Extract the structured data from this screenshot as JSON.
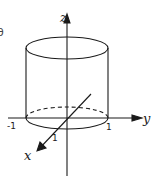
{
  "figure": {
    "type": "3d-axes-cylinder",
    "edge_fragment": "θ",
    "axes": {
      "x": {
        "label": "x",
        "tick_label": "1"
      },
      "y": {
        "label": "y",
        "tick_labels": [
          "-1",
          "1"
        ]
      },
      "z": {
        "label": "z"
      }
    },
    "shape": {
      "name": "cylinder",
      "radius": 1,
      "base_plane": "z=0",
      "hidden_edge_style": "dashed"
    },
    "colors": {
      "stroke": "#1a1a1a",
      "background": "#ffffff"
    }
  }
}
